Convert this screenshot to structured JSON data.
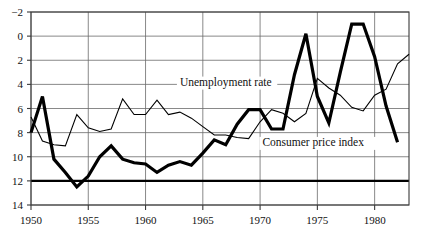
{
  "chart_data": {
    "type": "line",
    "title": "",
    "subtitle": "",
    "xlabel": "",
    "ylabel": "",
    "xlim": [
      1950,
      1983
    ],
    "ylim": [
      -2,
      14
    ],
    "yticks": [
      -2,
      0,
      2,
      4,
      6,
      8,
      10,
      12,
      14
    ],
    "xticks": [
      1950,
      1955,
      1960,
      1965,
      1970,
      1975,
      1980
    ],
    "grid": true,
    "legend_position": "inline-annotation",
    "x": [
      1950,
      1951,
      1952,
      1953,
      1954,
      1955,
      1956,
      1957,
      1958,
      1959,
      1960,
      1961,
      1962,
      1963,
      1964,
      1965,
      1966,
      1967,
      1968,
      1969,
      1970,
      1971,
      1972,
      1973,
      1974,
      1975,
      1976,
      1977,
      1978,
      1979,
      1980,
      1981,
      1982,
      1983
    ],
    "series": [
      {
        "name": "Unemployment rate",
        "style": "thin",
        "color": "#000000",
        "values": [
          5.3,
          3.3,
          3.0,
          2.9,
          5.5,
          4.4,
          4.1,
          4.3,
          6.8,
          5.5,
          5.5,
          6.7,
          5.5,
          5.7,
          5.2,
          4.5,
          3.8,
          3.8,
          3.6,
          3.5,
          4.9,
          5.9,
          5.6,
          4.9,
          5.6,
          8.5,
          7.7,
          7.1,
          6.1,
          5.8,
          7.1,
          7.6,
          9.7,
          10.5
        ]
      },
      {
        "name": "Consumer price index",
        "style": "bold",
        "color": "#000000",
        "values": [
          4.0,
          7.0,
          1.8,
          0.7,
          -0.5,
          0.4,
          2.0,
          2.9,
          1.8,
          1.5,
          1.4,
          0.7,
          1.3,
          1.6,
          1.3,
          2.3,
          3.4,
          3.0,
          4.7,
          5.9,
          5.9,
          4.3,
          4.3,
          8.8,
          12.2,
          7.0,
          4.8,
          9.0,
          13.0,
          13.0,
          10.3,
          6.2,
          3.2,
          null
        ]
      }
    ],
    "annotations": [
      {
        "text": "Unemployment rate",
        "x": 1963.0,
        "y": 7.9
      },
      {
        "text": "Consumer price index",
        "x": 1970.2,
        "y": 2.9
      }
    ]
  },
  "axis": {
    "y_labels": [
      "14",
      "12",
      "10",
      "8",
      "6",
      "4",
      "2",
      "0",
      "−2"
    ],
    "x_labels": [
      "1950",
      "1955",
      "1960",
      "1965",
      "1970",
      "1975",
      "1980"
    ]
  },
  "colors": {
    "grid": "#6b6b6b",
    "frame": "#3a3a3a",
    "ink": "#000000",
    "background": "#ffffff"
  }
}
